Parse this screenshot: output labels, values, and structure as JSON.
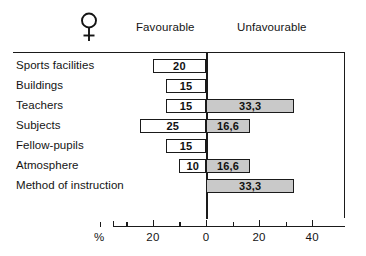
{
  "header": {
    "gender_icon": "female-symbol",
    "favourable_label": "Favourable",
    "unfavourable_label": "Unfavourable"
  },
  "axis": {
    "unit_label": "%",
    "tick_labels": [
      "20",
      "0",
      "20",
      "40"
    ],
    "tick_values": [
      -20,
      0,
      20,
      40
    ]
  },
  "colors": {
    "favourable_fill": "#ffffff",
    "unfavourable_fill": "#c9c9c9",
    "stroke": "#1a1a1a",
    "text": "#141414"
  },
  "chart_data": {
    "type": "bar",
    "title": "",
    "subtitle": "",
    "xlabel": "%",
    "ylabel": "",
    "orientation": "horizontal",
    "layout": "diverging",
    "grid": false,
    "legend_position": "top",
    "xlim": [
      -50,
      50
    ],
    "xticks": [
      -40,
      -30,
      -20,
      -10,
      0,
      10,
      20,
      30,
      40
    ],
    "xticklabels": [
      "",
      "",
      "20",
      "",
      "0",
      "",
      "20",
      "",
      "40"
    ],
    "categories": [
      "Sports facilities",
      "Buildings",
      "Teachers",
      "Subjects",
      "Fellow-pupils",
      "Atmosphere",
      "Method of instruction"
    ],
    "series": [
      {
        "name": "Favourable",
        "direction": "left",
        "values": [
          20,
          15,
          15,
          25,
          15,
          10,
          0
        ],
        "labels": [
          "20",
          "15",
          "15",
          "25",
          "15",
          "10",
          ""
        ]
      },
      {
        "name": "Unfavourable",
        "direction": "right",
        "values": [
          0,
          0,
          33.3,
          16.6,
          0,
          16.6,
          33.3
        ],
        "labels": [
          "",
          "",
          "33,3",
          "16,6",
          "",
          "16,6",
          "33,3"
        ]
      }
    ]
  },
  "rows": [
    {
      "label": "Sports facilities",
      "fav": 20,
      "fav_label": "20",
      "unfav": 0,
      "unfav_label": ""
    },
    {
      "label": "Buildings",
      "fav": 15,
      "fav_label": "15",
      "unfav": 0,
      "unfav_label": ""
    },
    {
      "label": "Teachers",
      "fav": 15,
      "fav_label": "15",
      "unfav": 33.3,
      "unfav_label": "33,3"
    },
    {
      "label": "Subjects",
      "fav": 25,
      "fav_label": "25",
      "unfav": 16.6,
      "unfav_label": "16,6"
    },
    {
      "label": "Fellow-pupils",
      "fav": 15,
      "fav_label": "15",
      "unfav": 0,
      "unfav_label": ""
    },
    {
      "label": "Atmosphere",
      "fav": 10,
      "fav_label": "10",
      "unfav": 16.6,
      "unfav_label": "16,6"
    },
    {
      "label": "Method of instruction",
      "fav": 0,
      "fav_label": "",
      "unfav": 33.3,
      "unfav_label": "33,3"
    }
  ]
}
